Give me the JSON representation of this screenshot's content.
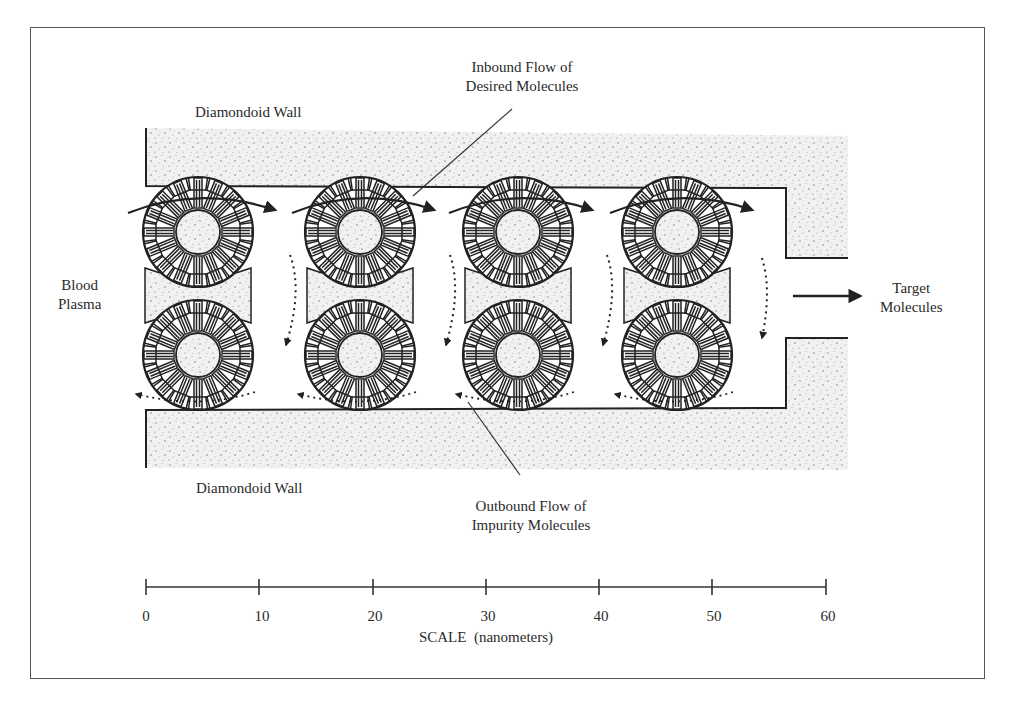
{
  "figure": {
    "labels": {
      "wall_top": "Diamondoid Wall",
      "wall_bottom": "Diamondoid Wall",
      "inbound_line1": "Inbound Flow of",
      "inbound_line2": "Desired Molecules",
      "outbound_line1": "Outbound Flow of",
      "outbound_line2": "Impurity Molecules",
      "blood_line1": "Blood",
      "blood_line2": "Plasma",
      "target_line1": "Target",
      "target_line2": "Molecules"
    },
    "rotor_columns": 4,
    "rotors_per_column": 2,
    "colors": {
      "ink": "#222222",
      "stipple": "#9a9a9a",
      "frame": "#555555",
      "background": "#ffffff"
    }
  },
  "scale": {
    "title": "SCALE  (nanometers)",
    "ticks": [
      "0",
      "10",
      "20",
      "30",
      "40",
      "50",
      "60"
    ],
    "unit": "nanometers",
    "min": 0,
    "max": 60,
    "step": 10
  }
}
